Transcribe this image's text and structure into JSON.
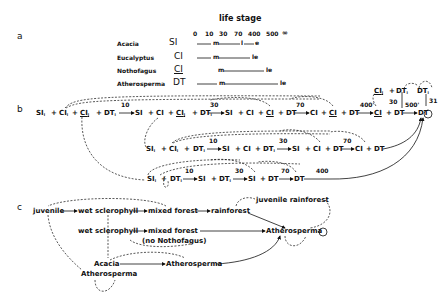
{
  "panel_a": {
    "label": "a",
    "title": "life stage",
    "ticks": [
      "0",
      "10",
      "30",
      "70",
      "400",
      "500",
      "∞"
    ],
    "rows": [
      {
        "species": "Acacia",
        "code": "SI",
        "markers": [
          "m",
          "l",
          "e"
        ]
      },
      {
        "species": "Eucalyptus",
        "code": "CI",
        "markers": [
          "m",
          "le"
        ]
      },
      {
        "species": "Nothofagus",
        "code": "CI",
        "underlined": true,
        "markers": [
          "m",
          "le"
        ]
      },
      {
        "species": "Atherosperma",
        "code": "DT",
        "markers": [
          "m",
          "le"
        ]
      }
    ]
  },
  "panel_b": {
    "label": "b",
    "row1": [
      "SI",
      "CI",
      "CI",
      "DT",
      "10",
      "SI",
      "CI",
      "CI",
      "DT",
      "30",
      "SI",
      "CI",
      "CI",
      "DT",
      "70",
      "CI",
      "CI",
      "DT",
      "400'",
      "CI",
      "DT",
      "500'",
      "DT"
    ],
    "row2": [
      "SI",
      "CI",
      "DT",
      "10",
      "SI",
      "CI",
      "DT",
      "30",
      "SI",
      "CI",
      "DT",
      "70",
      "CI",
      "DT"
    ],
    "row3": [
      "SI",
      "DT",
      "10",
      "SI",
      "DT",
      "30",
      "SI",
      "DT",
      "70",
      "DT",
      "400"
    ],
    "side": {
      "ci": "CI",
      "dt": "DT",
      "dt2": "DT",
      "n30": "30",
      "n31": "31"
    }
  },
  "panel_c": {
    "label": "c",
    "nodes": {
      "juvenile": "juvenile",
      "wet1": "wet sclerophyll",
      "mixed1": "mixed forest",
      "rainforest": "rainforest",
      "juvrain": "juvenile rainforest",
      "wet2": "wet sclerophyll",
      "mixed2": "mixed forest",
      "nonotho": "(no Nothofagus)",
      "athero1": "Atherosperma",
      "acacia": "Acacia",
      "athero2": "Atherosperma",
      "athero3": "Atherosperma"
    }
  }
}
